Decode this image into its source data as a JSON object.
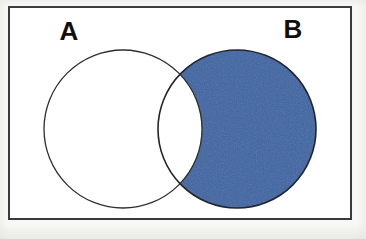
{
  "figure": {
    "type": "venn-diagram",
    "title": "",
    "width": 366,
    "height": 239,
    "background_color": "#f8f8f6",
    "paper_color": "#ffffff"
  },
  "universal_set": {
    "name": "universal-set-rectangle",
    "label": "",
    "x": 8,
    "y": 6,
    "width": 344,
    "height": 214,
    "stroke_color": "#3a3a3c",
    "stroke_width": 2,
    "fill_color": "#ffffff"
  },
  "sets": [
    {
      "id": "A",
      "label": "A",
      "label_x": 69,
      "label_y": 33,
      "cx": 123,
      "cy": 129,
      "r": 79,
      "fill_color": "#ffffff",
      "stroke_color": "#2e2e30",
      "stroke_width": 1.3,
      "shaded": false
    },
    {
      "id": "B",
      "label": "B",
      "label_x": 293,
      "label_y": 31,
      "cx": 237,
      "cy": 129,
      "r": 79,
      "fill_color": "#ffffff",
      "stroke_color": "#22252c",
      "stroke_width": 1.6,
      "shaded": true
    }
  ],
  "shading": {
    "region": "B \\ A",
    "region_label": "B minus A",
    "color": "#3b65a3",
    "edge_color": "#1d2a44",
    "includes_intersection": false,
    "intersection_fill": "#ffffff"
  },
  "labels": {
    "a": "A",
    "b": "B"
  },
  "chart_data": {
    "type": "venn",
    "title": "",
    "sets": [
      "A",
      "B"
    ],
    "regions": [
      {
        "id": "A-only",
        "expression": "A \\ B",
        "shaded": false,
        "fill": "#ffffff"
      },
      {
        "id": "intersection",
        "expression": "A ∩ B",
        "shaded": false,
        "fill": "#ffffff"
      },
      {
        "id": "B-only",
        "expression": "B \\ A",
        "shaded": true,
        "fill": "#3b65a3"
      },
      {
        "id": "outside",
        "expression": "U \\ (A ∪ B)",
        "shaded": false,
        "fill": "#ffffff"
      }
    ],
    "shaded_expression": "B \\ A",
    "legend": [],
    "grid": false
  }
}
